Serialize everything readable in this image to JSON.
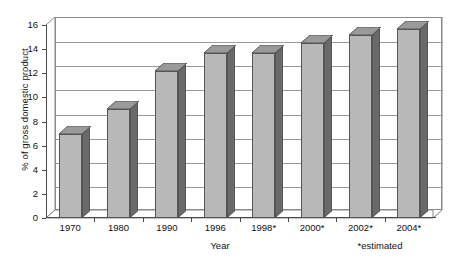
{
  "chart_data": {
    "type": "bar",
    "title": "",
    "subtitle": "",
    "categories": [
      "1970",
      "1980",
      "1990",
      "1996",
      "1998*",
      "2000*",
      "2002*",
      "2004*"
    ],
    "values": [
      7.0,
      9.0,
      12.2,
      13.7,
      13.7,
      14.5,
      15.2,
      15.7
    ],
    "series": [
      {
        "name": "% of gross domestic product",
        "values": [
          7.0,
          9.0,
          12.2,
          13.7,
          13.7,
          14.5,
          15.2,
          15.7
        ]
      }
    ],
    "xlabel": "Year",
    "ylabel": "% of gross domestic product",
    "ylim": [
      0,
      16
    ],
    "ytick_step": 2,
    "yticks": [
      "0",
      "2",
      "4",
      "6",
      "8",
      "10",
      "12",
      "14",
      "16"
    ],
    "grid": true,
    "grid_axis": "y",
    "legend": false,
    "legend_position": "none",
    "style": "3d-column",
    "annotations": [
      "*estimated"
    ]
  },
  "axes": {
    "y_title": "% of gross domestic product",
    "x_title": "Year",
    "footnote": "*estimated"
  },
  "colors": {
    "bar_front": "#b8b8b8",
    "bar_side": "#6a6a6a",
    "bar_top": "#9a9a9a",
    "bar_outline": "#555555",
    "gridline": "#9a9a9a",
    "axis": "#4a4a4a",
    "background": "#ffffff",
    "text": "#111111"
  }
}
